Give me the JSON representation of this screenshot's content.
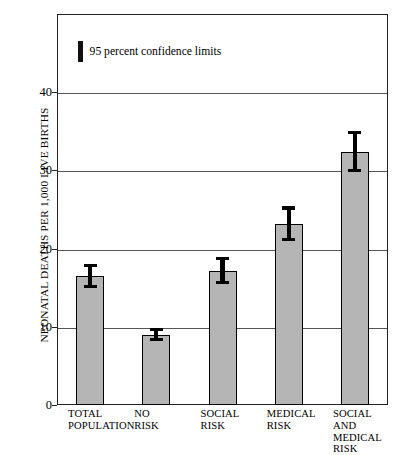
{
  "chart_data": {
    "type": "bar",
    "title": "",
    "subtitle": "",
    "xlabel": "",
    "ylabel": "NEONATAL DEATHS PER 1,000 LIVE BIRTHS",
    "ylim": [
      0,
      50
    ],
    "xlim": [
      0,
      5
    ],
    "grid": "horizontal",
    "yticks": [
      0,
      10,
      20,
      30,
      40
    ],
    "ytick_labels": [
      "0",
      "10",
      "20",
      "30",
      "40"
    ],
    "categories": [
      "TOTAL\nPOPULATION",
      "NO\nRISK",
      "SOCIAL\nRISK",
      "MEDICAL\nRISK",
      "SOCIAL AND\nMEDICAL\nRISK"
    ],
    "values": [
      16.5,
      9.0,
      17.1,
      23.1,
      32.4
    ],
    "error_low": [
      15.0,
      8.2,
      15.5,
      21.0,
      29.8
    ],
    "error_high": [
      18.0,
      9.9,
      18.9,
      25.4,
      35.0
    ],
    "series": [
      {
        "name": "Neonatal death rate",
        "values": [
          16.5,
          9.0,
          17.1,
          23.1,
          32.4
        ]
      }
    ],
    "legend": {
      "position": "inside-top-left",
      "entries": [
        {
          "label": "95 percent confidence limits",
          "marker": "vertical-bar",
          "color": "#111111"
        }
      ]
    },
    "colors": {
      "bar_fill": "#b5b5b5",
      "bar_edge": "#000000",
      "error_bar": "#000000",
      "gridline": "#555555",
      "frame": "#222222",
      "background": "#ffffff",
      "text": "#000000"
    }
  }
}
